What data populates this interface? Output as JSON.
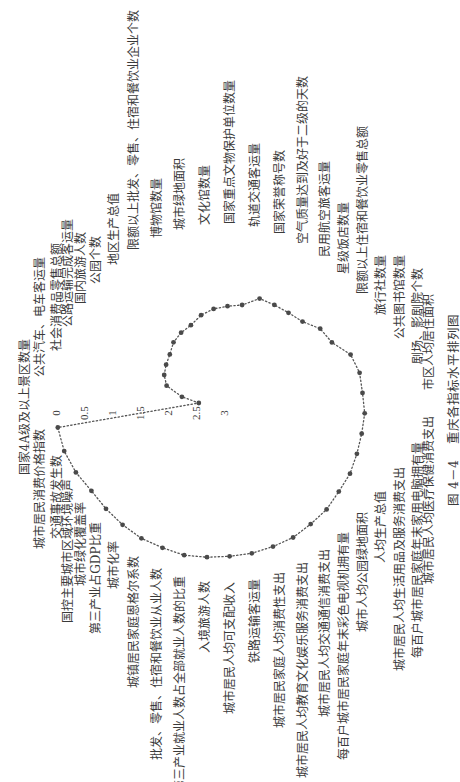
{
  "figure": {
    "caption_number": "图 4－4",
    "caption_title": "重庆各指标水平排列图"
  },
  "colors": {
    "background": "#ffffff",
    "text": "#3a3a3a",
    "marker": "#4a4a4a",
    "line": "#555555"
  },
  "chart_data": {
    "type": "radar",
    "title": "图 4－4 重庆各指标水平排列图",
    "orientation": "rotated 90° counterclockwise on page",
    "grid": false,
    "legend": null,
    "marker": "dot",
    "line_style": "dotted",
    "radial_axis": {
      "min": 0,
      "max": 3,
      "reversed": true,
      "ticks": [
        0,
        0.5,
        1,
        1.5,
        2,
        2.5,
        3
      ],
      "tick_labels": [
        "0",
        "0.5",
        "1",
        "1.5",
        "2",
        "2.5",
        "3"
      ]
    },
    "categories": [
      "国家4A级及以上景区数量",
      "公共汽车、电车客运量",
      "社会消费品零售总额",
      "公路运输完成客运量",
      "国内旅游人数",
      "公园个数",
      "地区生产总值",
      "限额以上批发、零售、住宿和餐饮业企业个数",
      "博物馆数量",
      "城市绿地面积",
      "文化馆数量",
      "国家重点文物保护单位数量",
      "轨道交通客运量",
      "国家荣誉称号数",
      "空气质量达到及好于二级的天数",
      "民用航空旅客运量",
      "星级饭店数量",
      "限额以上住宿和餐饮业零售总额",
      "旅行社数量",
      "公共图书馆数量",
      "剧场、影剧院个数",
      "市区人均居住面积",
      "城市居民人均医疗保健消费支出",
      "每百户城市居民家庭年末家用电脑拥有量",
      "城市居民人均生活用品及服务消费支出",
      "人均生产总值",
      "城市人均公园绿地面积",
      "每百户城市居民家庭年末彩色电视机拥有量",
      "城市居民人均交通通信消费支出",
      "城市居民人均教育文化娱乐服务消费支出",
      "城市居民家庭人均消费性支出",
      "铁路运输客运量",
      "城市居民人均可支配收入",
      "入境旅游人数",
      "第三产业就业人数占全部就业人数的比重",
      "批发、零售、住宿和餐饮业从业人数",
      "城镇居民家庭恩格尔系数",
      "城市化率",
      "第三产业占GDP比重",
      "城市绿化覆盖率",
      "国控主要城市区域环境噪声",
      "交通事故发生数",
      "城市居民消费价格指数"
    ],
    "values": [
      2.55,
      2.24,
      1.93,
      1.82,
      1.76,
      1.7,
      1.59,
      1.53,
      1.49,
      1.38,
      1.31,
      1.27,
      1.22,
      1.03,
      1.03,
      1.02,
      0.98,
      0.83,
      0.79,
      0.58,
      0.52,
      0.52,
      0.48,
      0.48,
      0.46,
      0.42,
      0.41,
      0.36,
      0.34,
      0.3,
      0.29,
      0.27,
      0.26,
      0.23,
      0.19,
      0.19,
      0.17,
      0.17,
      0.17,
      0.16,
      0.08,
      0.02,
      0.0
    ]
  }
}
